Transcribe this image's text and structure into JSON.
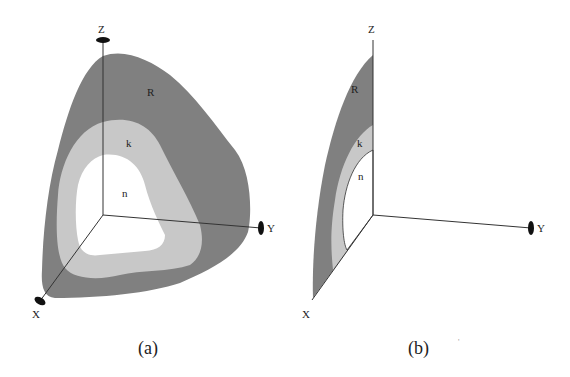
{
  "colors": {
    "region_R": "#808080",
    "region_k": "#c8c8c8",
    "region_n": "#ffffff",
    "axis": "#333333",
    "axis_marker": "#111111"
  },
  "panel_a": {
    "caption": "(a)",
    "axes": {
      "x": "X",
      "y": "Y",
      "z": "Z"
    },
    "regions": {
      "outer": "R",
      "middle": "k",
      "inner": "n"
    }
  },
  "panel_b": {
    "caption": "(b)",
    "axes": {
      "x": "X",
      "y": "Y",
      "z": "Z"
    },
    "regions": {
      "outer": "R",
      "middle": "k",
      "inner": "n"
    }
  }
}
